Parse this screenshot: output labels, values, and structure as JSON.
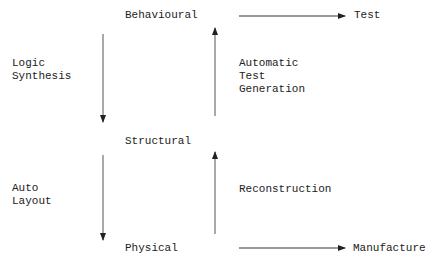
{
  "diagram": {
    "levels": {
      "behavioural": "Behavioural",
      "structural": "Structural",
      "physical": "Physical"
    },
    "outputs": {
      "test": "Test",
      "manufacture": "Manufacture"
    },
    "transitions": {
      "logic_synthesis": [
        "Logic",
        "Synthesis"
      ],
      "auto_layout": [
        "Auto",
        "Layout"
      ],
      "automatic_test_generation": [
        "Automatic",
        "Test",
        "Generation"
      ],
      "reconstruction": "Reconstruction"
    },
    "edges": [
      {
        "from": "Behavioural",
        "to": "Structural",
        "label": "Logic Synthesis",
        "direction": "down"
      },
      {
        "from": "Structural",
        "to": "Behavioural",
        "label": "Automatic Test Generation",
        "direction": "up"
      },
      {
        "from": "Structural",
        "to": "Physical",
        "label": "Auto Layout",
        "direction": "down"
      },
      {
        "from": "Physical",
        "to": "Structural",
        "label": "Reconstruction",
        "direction": "up"
      },
      {
        "from": "Behavioural",
        "to": "Test",
        "label": "",
        "direction": "right"
      },
      {
        "from": "Physical",
        "to": "Manufacture",
        "label": "",
        "direction": "right"
      }
    ],
    "colors": {
      "line": "#333333",
      "text": "#222222",
      "background": "#ffffff"
    }
  }
}
